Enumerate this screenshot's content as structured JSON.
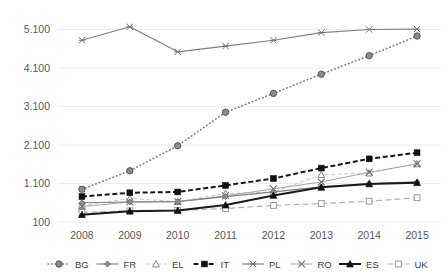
{
  "chart_data": {
    "type": "line",
    "title": "",
    "subtitle": "",
    "xlabel": "",
    "ylabel": "",
    "x": [
      "2008",
      "2009",
      "2010",
      "2011",
      "2012",
      "2013",
      "2014",
      "2015"
    ],
    "ytick_labels": [
      "100",
      "1.100",
      "2.100",
      "3.100",
      "4.100",
      "5.100"
    ],
    "ytick_values": [
      100,
      1100,
      2100,
      3100,
      4100,
      5100
    ],
    "ylim": [
      100,
      5450
    ],
    "grid": true,
    "legend_position": "bottom",
    "number_format": "european-thousands-dot",
    "series": [
      {
        "name": "BG",
        "marker": "circle",
        "line_style": "dotted",
        "color": "#7f7f7f",
        "values": [
          950,
          1430,
          2080,
          2950,
          3440,
          3940,
          4420,
          4930
        ]
      },
      {
        "name": "FR",
        "marker": "diamond",
        "line_style": "solid",
        "color": "#808080",
        "values": [
          600,
          620,
          630,
          760,
          880,
          1010,
          1100,
          1140
        ]
      },
      {
        "name": "EL",
        "marker": "triangle-open",
        "line_style": "dashed",
        "color": "#c8c8c8",
        "values": [
          530,
          710,
          630,
          840,
          880,
          1330,
          1370,
          1610
        ]
      },
      {
        "name": "IT",
        "marker": "square",
        "line_style": "dashed-bold",
        "color": "#1a1a1a",
        "values": [
          760,
          860,
          880,
          1050,
          1230,
          1500,
          1740,
          1900
        ]
      },
      {
        "name": "PL",
        "marker": "star-x",
        "line_style": "solid",
        "color": "#7f7f7f",
        "values": [
          4820,
          5170,
          4520,
          4670,
          4820,
          5020,
          5100,
          5110
        ]
      },
      {
        "name": "RO",
        "marker": "x",
        "line_style": "solid-light",
        "color": "#a6a6a6",
        "values": [
          500,
          620,
          630,
          780,
          960,
          1140,
          1390,
          1610
        ]
      },
      {
        "name": "ES",
        "marker": "triangle",
        "line_style": "solid-bold",
        "color": "#1a1a1a",
        "values": [
          290,
          380,
          400,
          540,
          790,
          1000,
          1090,
          1120
        ]
      },
      {
        "name": "UK",
        "marker": "square-open",
        "line_style": "dashed-long",
        "color": "#b0b0b0",
        "values": [
          350,
          390,
          400,
          450,
          530,
          580,
          640,
          730
        ]
      }
    ]
  },
  "legend": {
    "items": [
      {
        "label": "BG"
      },
      {
        "label": "FR"
      },
      {
        "label": "EL"
      },
      {
        "label": "IT"
      },
      {
        "label": "PL"
      },
      {
        "label": "RO"
      },
      {
        "label": "ES"
      },
      {
        "label": "UK"
      }
    ]
  }
}
